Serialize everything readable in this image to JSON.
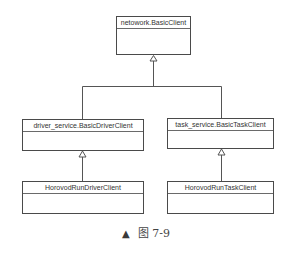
{
  "diagram": {
    "type": "uml-class-hierarchy",
    "classes": [
      {
        "id": "root",
        "name": "netowork.BasicClient"
      },
      {
        "id": "driver",
        "name": "driver_service.BasicDriverClient"
      },
      {
        "id": "task",
        "name": "task_service.BasicTaskClient"
      },
      {
        "id": "run_driver",
        "name": "HorovodRunDriverClient"
      },
      {
        "id": "run_task",
        "name": "HorovodRunTaskClient"
      }
    ],
    "edges": [
      {
        "from": "driver",
        "to": "root",
        "type": "inheritance"
      },
      {
        "from": "task",
        "to": "root",
        "type": "inheritance"
      },
      {
        "from": "run_driver",
        "to": "driver",
        "type": "inheritance"
      },
      {
        "from": "run_task",
        "to": "task",
        "type": "inheritance"
      }
    ]
  },
  "caption": {
    "marker": "▲",
    "text": "图 7-9"
  },
  "colors": {
    "line": "#4a4a4a",
    "text": "#333333"
  }
}
